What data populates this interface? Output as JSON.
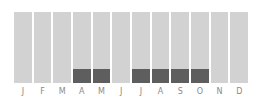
{
  "chart_data": {
    "type": "bar",
    "stacked": true,
    "title": "",
    "xlabel": "",
    "ylabel": "",
    "categories": [
      "J",
      "F",
      "M",
      "A",
      "M",
      "J",
      "J",
      "A",
      "S",
      "O",
      "N",
      "D"
    ],
    "series": [
      {
        "name": "highlighted",
        "color": "#5e5e5e",
        "values": [
          0,
          0,
          0,
          1,
          1,
          0,
          1,
          1,
          1,
          1,
          0,
          0
        ]
      },
      {
        "name": "background",
        "color": "#d2d2d2",
        "values": [
          1,
          1,
          1,
          1,
          1,
          1,
          1,
          1,
          1,
          1,
          1,
          1
        ]
      }
    ],
    "highlight_fraction": 0.2,
    "grid": false,
    "legend": "none"
  }
}
